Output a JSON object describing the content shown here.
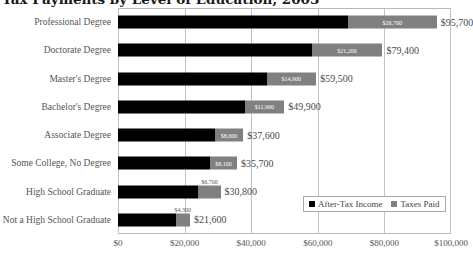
{
  "chart_data": {
    "type": "bar",
    "title": "Tax Payments by Level of Education, 2003",
    "xlabel": "",
    "ylabel": "",
    "xlim": [
      0,
      100000
    ],
    "xticks": [
      "$0",
      "$20,000",
      "$40,000",
      "$60,000",
      "$80,000",
      "$100,000"
    ],
    "xtick_values": [
      0,
      20000,
      40000,
      60000,
      80000,
      100000
    ],
    "grid": true,
    "legend_position": "bottom-right",
    "orientation": "horizontal",
    "stacked": true,
    "categories": [
      "Professional Degree",
      "Doctorate Degree",
      "Master's Degree",
      "Bachelor's Degree",
      "Associate Degree",
      "Some College, No Degree",
      "High School Graduate",
      "Not a High School Graduate"
    ],
    "series": [
      {
        "name": "After-Tax Income",
        "color": "#000000",
        "values": [
          69000,
          58200,
          44600,
          38000,
          29000,
          27600,
          24100,
          17300
        ]
      },
      {
        "name": "Taxes Paid",
        "color": "#808080",
        "values": [
          26700,
          21200,
          14900,
          11900,
          8600,
          8100,
          6700,
          4300
        ]
      }
    ],
    "totals": [
      95700,
      79400,
      59500,
      49900,
      37600,
      35700,
      30800,
      21600
    ],
    "total_labels": [
      "$95,700",
      "$79,400",
      "$59,500",
      "$49,900",
      "$37,600",
      "$35,700",
      "$30,800",
      "$21,600"
    ],
    "tax_labels": [
      "$26,700",
      "$21,200",
      "$14,900",
      "$11,900",
      "$8,600",
      "$8,100",
      "$6,700",
      "$4,300"
    ]
  },
  "legend": {
    "items": [
      {
        "label": "After-Tax Income",
        "color": "#000000"
      },
      {
        "label": "Taxes Paid",
        "color": "#808080"
      }
    ]
  }
}
